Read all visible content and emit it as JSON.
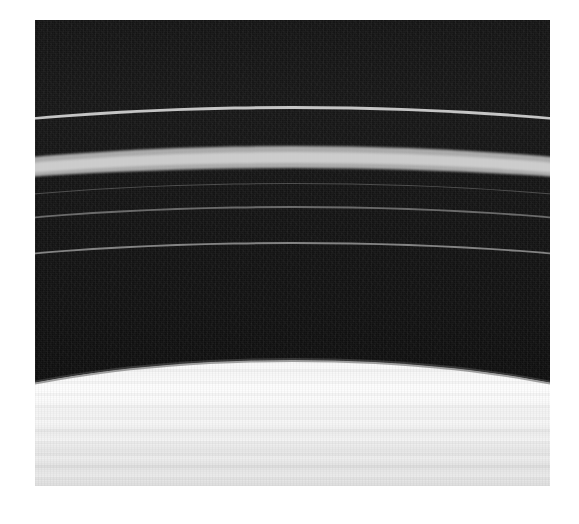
{
  "image": {
    "kind": "astronomical-photograph",
    "subject": "planetary ring system",
    "caption": "",
    "frame": {
      "left_px": 35,
      "top_px": 20,
      "width_px": 515,
      "height_px": 466,
      "background_color": "#ffffff"
    },
    "palette": {
      "page_background": "#ffffff",
      "dark_sky": "#131313",
      "dark_sky_lower": "#0e0e0e",
      "narrow_ringlet": "#d4d4d4",
      "main_bright_ring": "#cdcdcd",
      "main_bright_ring_halo": "#b0b0b0",
      "faint_ringlet_1": "#606060",
      "faint_ringlet_2": "#808080",
      "faint_ringlet_3": "#969696",
      "bright_sheet_highlight": "#fdfdfd",
      "bright_sheet_shadow": "#d2d2d2",
      "sheet_edge_lane": "#464646"
    },
    "features": [
      {
        "id": "dark-field",
        "label": "dark ring-gap region",
        "top_px": 20,
        "height_px": 360,
        "brightness": "very dark",
        "description": "Noisy near-black background occupying the upper portion of the frame."
      },
      {
        "id": "ring-upper-narrow",
        "label": "narrow bright ringlet",
        "top_px": 108,
        "thickness_px": 3,
        "brightness": "bright",
        "curvature": "gentle upward arc toward frame edges"
      },
      {
        "id": "ring-main-bright",
        "label": "broad bright ring",
        "top_px": 152,
        "thickness_px": 24,
        "brightness": "brightest narrow band",
        "curvature": "gentle upward arc toward frame edges"
      },
      {
        "id": "ring-faint-1",
        "label": "faint ringlet 1",
        "top_px": 185,
        "thickness_px": 2,
        "brightness": "very faint"
      },
      {
        "id": "ring-faint-2",
        "label": "faint ringlet 2",
        "top_px": 209,
        "thickness_px": 2,
        "brightness": "faint"
      },
      {
        "id": "ring-faint-3",
        "label": "faint ringlet 3",
        "top_px": 245,
        "thickness_px": 3,
        "brightness": "faint"
      },
      {
        "id": "bright-sheet",
        "label": "broad bright ring sheet",
        "top_px": 372,
        "height_px": 114,
        "brightness": "very bright",
        "curvature": "arc sagging downward at frame center",
        "description": "Wide high-albedo ring region filling the bottom of the frame, crossed by subtle darker bands."
      }
    ]
  }
}
